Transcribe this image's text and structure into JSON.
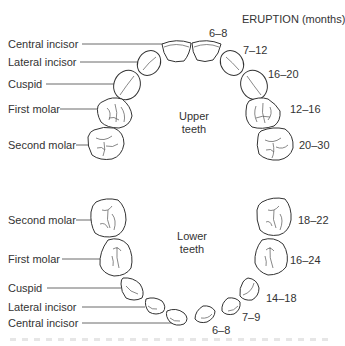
{
  "title": "ERUPTION (months)",
  "upper": {
    "jaw_label": [
      "Upper",
      "teeth"
    ],
    "teeth": [
      {
        "name": "Central incisor",
        "eruption": "6–8"
      },
      {
        "name": "Lateral incisor",
        "eruption": "7–12"
      },
      {
        "name": "Cuspid",
        "eruption": "16–20"
      },
      {
        "name": "First molar",
        "eruption": "12–16"
      },
      {
        "name": "Second molar",
        "eruption": "20–30"
      }
    ]
  },
  "lower": {
    "jaw_label": [
      "Lower",
      "teeth"
    ],
    "teeth": [
      {
        "name": "Second molar",
        "eruption": "18–22"
      },
      {
        "name": "First molar",
        "eruption": "16–24"
      },
      {
        "name": "Cuspid",
        "eruption": "14–18"
      },
      {
        "name": "Lateral incisor",
        "eruption": "7–9"
      },
      {
        "name": "Central incisor",
        "eruption": "6–8"
      }
    ]
  }
}
